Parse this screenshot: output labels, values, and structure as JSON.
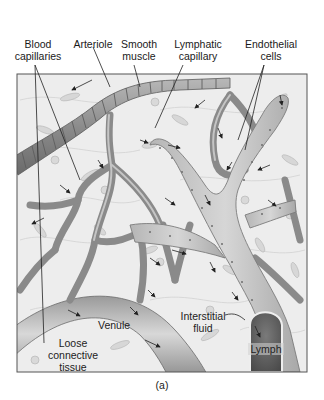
{
  "figure": {
    "caption": "(a)",
    "colors": {
      "background": "#ffffff",
      "tissue": "#ececec",
      "vessel": "#9a9a9a",
      "vessel_dark": "#6e6e6e",
      "lymphatic": "#c9c9c9",
      "frame": "#555555",
      "text": "#1a1a1a"
    },
    "top_labels": [
      {
        "id": "blood-capillaries",
        "line1": "Blood",
        "line2": "capillaries"
      },
      {
        "id": "arteriole",
        "line1": "Arteriole",
        "line2": ""
      },
      {
        "id": "smooth-muscle",
        "line1": "Smooth",
        "line2": "muscle"
      },
      {
        "id": "lymphatic-capillary",
        "line1": "Lymphatic",
        "line2": "capillary"
      },
      {
        "id": "endothelial-cells",
        "line1": "Endothelial",
        "line2": "cells"
      }
    ],
    "inner_labels": {
      "venule": "Venule",
      "interstitial_line1": "Interstitial",
      "interstitial_line2": "fluid",
      "loose_line1": "Loose",
      "loose_line2": "connective",
      "loose_line3": "tissue",
      "lymph": "Lymph"
    }
  }
}
